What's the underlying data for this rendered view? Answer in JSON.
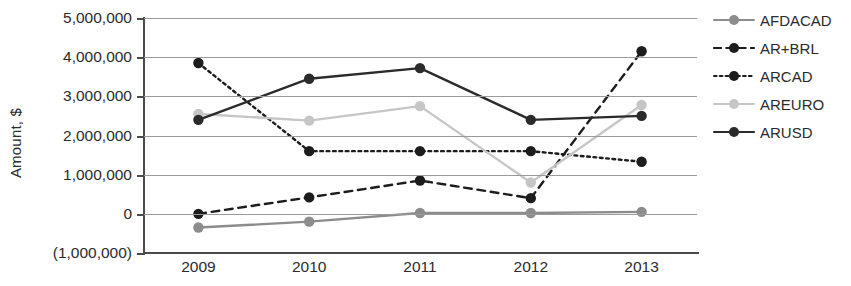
{
  "chart_data": {
    "type": "line",
    "title": "",
    "xlabel": "",
    "ylabel": "Amount, $",
    "categories": [
      "2009",
      "2010",
      "2011",
      "2012",
      "2013"
    ],
    "x": [
      2009,
      2010,
      2011,
      2012,
      2013
    ],
    "ylim": [
      -1000000,
      5000000
    ],
    "ytick_values": [
      5000000,
      4000000,
      3000000,
      2000000,
      1000000,
      0,
      -1000000
    ],
    "ytick_labels": [
      "5,000,000",
      "4,000,000",
      "3,000,000",
      "2,000,000",
      "1,000,000",
      "0",
      "(1,000,000)"
    ],
    "grid": true,
    "legend_position": "right",
    "series": [
      {
        "name": "AFDACAD",
        "values": [
          -350000,
          -200000,
          20000,
          20000,
          50000
        ],
        "color": "#8c8c8c",
        "dash": "none",
        "marker": "circle"
      },
      {
        "name": "AR+BRL",
        "values": [
          0,
          420000,
          850000,
          400000,
          4150000
        ],
        "color": "#1c1c1c",
        "dash": "dashed",
        "marker": "circle"
      },
      {
        "name": "ARCAD",
        "values": [
          3850000,
          1600000,
          1600000,
          1600000,
          1330000
        ],
        "color": "#1c1c1c",
        "dash": "dotted",
        "marker": "circle"
      },
      {
        "name": "AREURO",
        "values": [
          2550000,
          2380000,
          2750000,
          800000,
          2780000
        ],
        "color": "#c6c6c6",
        "dash": "none",
        "marker": "circle"
      },
      {
        "name": "ARUSD",
        "values": [
          2400000,
          3450000,
          3720000,
          2400000,
          2500000
        ],
        "color": "#2b2b2b",
        "dash": "none",
        "marker": "circle"
      }
    ]
  },
  "axis": {
    "y_title": "Amount, $"
  },
  "colors": {
    "gridline": "#9a9a9a",
    "axis": "#4a4a4a",
    "text": "#2b2b2b",
    "background": "#ffffff"
  }
}
